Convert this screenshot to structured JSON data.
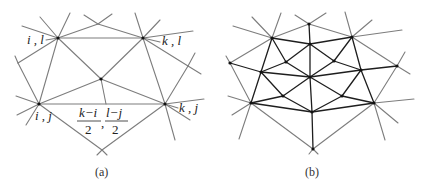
{
  "figure": {
    "panel_a": {
      "caption": "(a)",
      "labels": {
        "top_left": "i , l",
        "top_right": "k , l",
        "bottom_left": "i , j",
        "bottom_right": "k , j"
      },
      "midpoint_fraction": {
        "num1": "k−i",
        "den1": "2",
        "separator": ",",
        "num2": "l−j",
        "den2": "2"
      },
      "vertices": {
        "A_il": [
          58,
          38
        ],
        "B_kl": [
          143,
          38
        ],
        "C_center": [
          101,
          79
        ],
        "D_ij": [
          39,
          104
        ],
        "E_kj": [
          165,
          104
        ],
        "F_bottom": [
          102,
          150
        ],
        "G_top": [
          98,
          24
        ],
        "H_left": [
          18,
          63
        ],
        "I_right": [
          188,
          66
        ]
      }
    },
    "panel_b": {
      "caption": "(b)",
      "description": "Subdivided mesh: inner edges drawn dark, outer spokes gray"
    },
    "colors": {
      "edge_gray": "#7d7d7d",
      "edge_dark": "#1e1e1e",
      "vertex": "#111111",
      "background": "#ffffff"
    }
  }
}
